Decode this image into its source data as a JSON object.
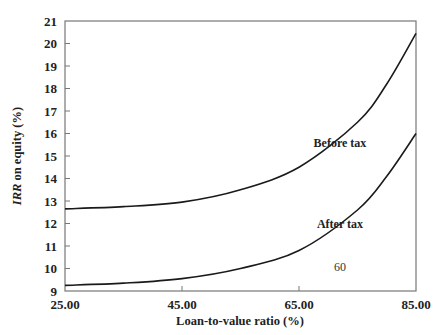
{
  "chart_data": {
    "type": "line",
    "title": "",
    "xlabel": "Loan-to-value ratio (%)",
    "ylabel_italic": "IRR",
    "ylabel_rest": " on equity (%)",
    "ylabel": "IRR on equity (%)",
    "xlim": [
      25,
      85
    ],
    "ylim": [
      9,
      21
    ],
    "x_ticks": [
      "25.00",
      "45.00",
      "65.00",
      "85.00"
    ],
    "x_tick_values": [
      25,
      45,
      65,
      85
    ],
    "y_ticks": [
      9,
      10,
      11,
      12,
      13,
      14,
      15,
      16,
      17,
      18,
      19,
      20,
      21
    ],
    "grid": false,
    "legend": "inline labels",
    "series": [
      {
        "name": "Before tax",
        "x": [
          25,
          35,
          45,
          55,
          65,
          75,
          80,
          85
        ],
        "values": [
          12.65,
          12.75,
          12.95,
          13.5,
          14.5,
          16.5,
          18.2,
          20.45
        ]
      },
      {
        "name": "After tax",
        "x": [
          25,
          35,
          45,
          55,
          65,
          75,
          80,
          85
        ],
        "values": [
          9.25,
          9.35,
          9.55,
          10.0,
          10.8,
          12.6,
          14.1,
          16.0
        ]
      }
    ],
    "annotations": [
      {
        "text": "Before tax",
        "x": 72,
        "y": 15.4
      },
      {
        "text": "After tax",
        "x": 72,
        "y": 11.8
      },
      {
        "text": "60",
        "x": 72,
        "y": 9.9
      }
    ]
  }
}
